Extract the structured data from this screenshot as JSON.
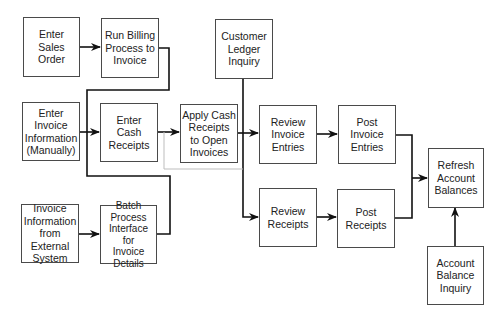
{
  "diagram": {
    "nodes": {
      "enter_sales_order": "Enter\nSales\nOrder",
      "run_billing": "Run Billing\nProcess to\nInvoice",
      "customer_ledger_inquiry": "Customer\nLedger\nInquiry",
      "enter_invoice_manual": "Enter\nInvoice\nInformation\n(Manually)",
      "enter_cash_receipts": "Enter\nCash\nReceipts",
      "apply_cash_receipts": "Apply Cash\nReceipts\nto Open\nInvoices",
      "review_invoice_entries": "Review\nInvoice\nEntries",
      "post_invoice_entries": "Post\nInvoice\nEntries",
      "refresh_account_balances": "Refresh\nAccount\nBalances",
      "invoice_info_external": "Invoice\nInformation\nfrom\nExternal\nSystem",
      "batch_process_interface": "Batch\nProcess\nInterface for\nInvoice\nDetails",
      "review_receipts": "Review\nReceipts",
      "post_receipts": "Post\nReceipts",
      "account_balance_inquiry": "Account\nBalance\nInquiry"
    },
    "edges": [
      {
        "from": "Enter Sales Order",
        "to": "Run Billing Process to Invoice"
      },
      {
        "from": "Run Billing Process to Invoice",
        "to": "Review Invoice Entries"
      },
      {
        "from": "Enter Invoice Information (Manually)",
        "to": "Review Invoice Entries"
      },
      {
        "from": "Invoice Information from External System",
        "to": "Batch Process Interface for Invoice Details"
      },
      {
        "from": "Batch Process Interface for Invoice Details",
        "to": "Review Invoice Entries"
      },
      {
        "from": "Enter Cash Receipts",
        "to": "Apply Cash Receipts to Open Invoices"
      },
      {
        "from": "Enter Cash Receipts",
        "to": "Review Receipts"
      },
      {
        "from": "Apply Cash Receipts to Open Invoices",
        "to": "Review Invoice Entries"
      },
      {
        "from": "Customer Ledger Inquiry",
        "to": "Review Receipts"
      },
      {
        "from": "Review Invoice Entries",
        "to": "Post Invoice Entries"
      },
      {
        "from": "Review Receipts",
        "to": "Post Receipts"
      },
      {
        "from": "Post Invoice Entries",
        "to": "Refresh Account Balances"
      },
      {
        "from": "Post Receipts",
        "to": "Refresh Account Balances"
      },
      {
        "from": "Account Balance Inquiry",
        "to": "Refresh Account Balances"
      }
    ],
    "colors": {
      "line": "#111111",
      "secondary_line": "#bdbdbd",
      "box_border": "#4a4a4a"
    }
  }
}
